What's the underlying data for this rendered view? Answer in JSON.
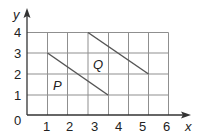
{
  "diagram": {
    "type": "coordinate-grid",
    "x_axis": {
      "label": "x",
      "ticks": [
        "1",
        "2",
        "3",
        "4",
        "5",
        "6"
      ]
    },
    "y_axis": {
      "label": "y",
      "ticks": [
        "1",
        "2",
        "3",
        "4"
      ]
    },
    "origin_label": "0",
    "shapes": [
      {
        "name": "P",
        "label": "P",
        "vertices": [
          [
            1,
            3
          ],
          [
            1,
            1
          ],
          [
            4,
            1
          ]
        ]
      },
      {
        "name": "Q",
        "label": "Q",
        "vertices": [
          [
            3,
            4
          ],
          [
            3,
            2
          ],
          [
            6,
            2
          ]
        ]
      }
    ],
    "colors": {
      "grid": "#8a8a8a",
      "axis": "#333333",
      "shape": "#555555",
      "text": "#222222"
    }
  }
}
